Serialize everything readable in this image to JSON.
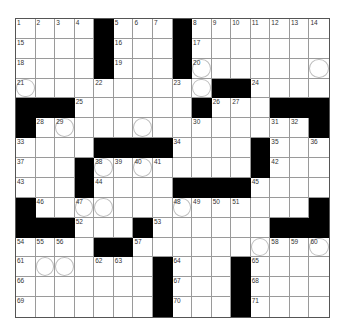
{
  "puzzle": {
    "cols": 16,
    "rows": 15,
    "layout": [
      "....#...#.......",
      "....#...#.......",
      "....#...#.......",
      "..........##....",
      "###......#...###",
      "#..............#",
      "....####....#...",
      "...#........#...",
      "...#....####....",
      "#..............#",
      "###...#......###",
      "....##..........",
      ".......#...#....",
      ".......#...#....",
      ".......#...#...."
    ],
    "numbers": {
      "0,0": "1",
      "0,1": "2",
      "0,2": "3",
      "0,3": "4",
      "0,5": "5",
      "0,6": "6",
      "0,7": "7",
      "0,9": "8",
      "0,10": "9",
      "0,11": "10",
      "0,12": "11",
      "0,13": "12",
      "0,14": "13",
      "0,15": "14",
      "1,0": "15",
      "1,5": "16",
      "1,9": "17",
      "2,0": "18",
      "2,5": "19",
      "2,9": "20",
      "3,0": "21",
      "3,4": "22",
      "3,8": "23",
      "3,12": "24",
      "4,3": "25",
      "4,10": "26",
      "4,11": "27",
      "5,1": "28",
      "5,2": "29",
      "5,9": "30",
      "5,13": "31",
      "5,14": "32",
      "6,0": "33",
      "6,8": "34",
      "6,13": "35",
      "6,15": "36",
      "7,0": "37",
      "7,4": "38",
      "7,5": "39",
      "7,6": "40",
      "7,7": "41",
      "7,13": "42",
      "8,0": "43",
      "8,4": "44",
      "8,12": "45",
      "9,1": "46",
      "9,3": "47",
      "9,8": "48",
      "9,9": "49",
      "9,10": "50",
      "9,11": "51",
      "10,3": "52",
      "10,7": "53",
      "11,0": "54",
      "11,1": "55",
      "11,2": "56",
      "11,6": "57",
      "11,13": "58",
      "11,14": "59",
      "11,15": "60",
      "12,0": "61",
      "12,4": "62",
      "12,5": "63",
      "12,8": "64",
      "12,12": "65",
      "13,0": "66",
      "13,8": "67",
      "13,12": "68",
      "14,0": "69",
      "14,8": "70",
      "14,12": "71"
    },
    "circles": [
      "2,9",
      "2,15",
      "3,0",
      "3,9",
      "5,2",
      "5,6",
      "7,4",
      "7,6",
      "9,3",
      "9,4",
      "9,8",
      "11,12",
      "11,15",
      "12,1",
      "12,2"
    ],
    "colors": {
      "block": "#000000",
      "grid_line": "#9a9a9a",
      "circle": "#bdbdbd",
      "background": "#ffffff"
    }
  }
}
